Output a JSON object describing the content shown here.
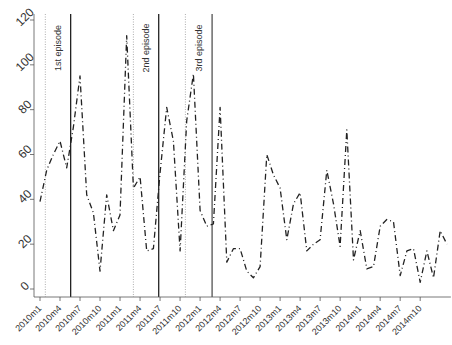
{
  "chart_data": {
    "type": "line",
    "title": "",
    "xlabel": "",
    "ylabel": "",
    "ylim": [
      0,
      120
    ],
    "yticks": [
      0,
      20,
      40,
      60,
      80,
      100,
      120
    ],
    "grid": false,
    "legend": null,
    "x_tick_labels": [
      "2010m1",
      "2010m4",
      "2010m7",
      "2010m10",
      "2011m1",
      "2011m4",
      "2011m7",
      "2011m10",
      "2012m1",
      "2012m4",
      "2012m7",
      "2012m10",
      "2013m1",
      "2013m4",
      "2013m7",
      "2013m10",
      "2014m1",
      "2014m4",
      "2014m7",
      "2014m10"
    ],
    "x_start": "2010m1",
    "x_frequency": "monthly",
    "series": [
      {
        "name": "series",
        "style": "dashed",
        "color": "#222222",
        "values": [
          39,
          53,
          60,
          66,
          54,
          72,
          95,
          42,
          34,
          8,
          42,
          26,
          33,
          113,
          45,
          50,
          17,
          18,
          52,
          81,
          66,
          17,
          75,
          96,
          35,
          28,
          29,
          81,
          12,
          18,
          18,
          8,
          5,
          10,
          60,
          51,
          45,
          22,
          38,
          43,
          17,
          20,
          22,
          53,
          38,
          19,
          71,
          13,
          26,
          9,
          10,
          28,
          31,
          30,
          6,
          17,
          18,
          3,
          17,
          5,
          26,
          20
        ]
      }
    ],
    "vertical_lines": [
      {
        "month_index": 0.8,
        "style": "dotted",
        "color": "#999999"
      },
      {
        "month_index": 4.6,
        "style": "solid",
        "color": "#111111",
        "label": "1st episode"
      },
      {
        "month_index": 14.0,
        "style": "dotted",
        "color": "#999999"
      },
      {
        "month_index": 17.8,
        "style": "solid",
        "color": "#111111",
        "label": "2nd episode"
      },
      {
        "month_index": 21.8,
        "style": "dotted",
        "color": "#999999"
      },
      {
        "month_index": 25.8,
        "style": "solid",
        "color": "#444444",
        "label": "3rd episode"
      }
    ],
    "annotations": [
      "1st episode",
      "2nd episode",
      "3rd episode"
    ]
  }
}
